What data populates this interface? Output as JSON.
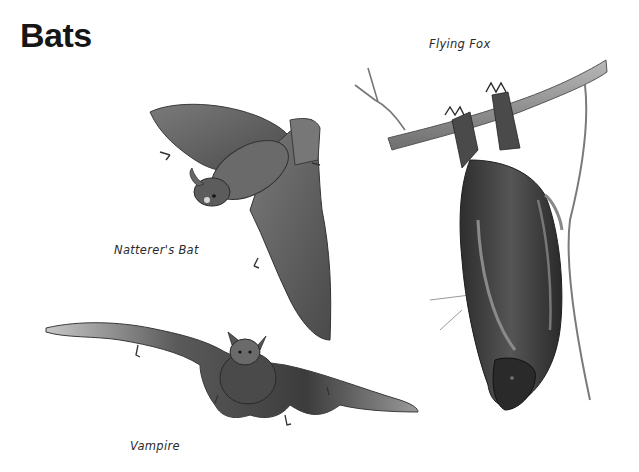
{
  "page": {
    "title": "Bats",
    "illustrations": [
      {
        "id": "flying-fox",
        "caption": "Flying Fox"
      },
      {
        "id": "natterers-bat",
        "caption": "Natterer's Bat"
      },
      {
        "id": "vampire",
        "caption": "Vampire"
      }
    ]
  },
  "colors": {
    "background": "#ffffff",
    "ink": "#161616",
    "caption": "#2a2a2a",
    "fur_dark": "#3a3a3a",
    "membrane": "#5e5e5e",
    "branch": "#8c8c8c"
  }
}
